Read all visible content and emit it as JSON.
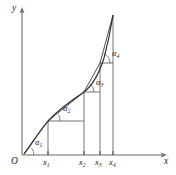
{
  "figure": {
    "background_color": "#ffffff",
    "curve_color": "#2b2b2b",
    "axis_color": "#6b6b6b"
  },
  "axes": {
    "y_label": "y",
    "x_label": "x",
    "origin_label": "O",
    "x_axis_y": 155,
    "y_axis_x": 22,
    "x_axis_end": 168,
    "y_axis_top": 8
  },
  "ticks": [
    {
      "id": "x1",
      "label": "x",
      "subscript": "1",
      "x": 48
    },
    {
      "id": "x2",
      "label": "x",
      "subscript": "2",
      "x": 84
    },
    {
      "id": "x3",
      "label": "x",
      "subscript": "3",
      "x": 100
    },
    {
      "id": "x4",
      "label": "x",
      "subscript": "4",
      "x": 113
    }
  ],
  "angles": [
    {
      "id": "alpha1",
      "label": "α",
      "subscript": "1",
      "at_x": 22,
      "at_y": 155,
      "label_x": 35,
      "label_y": 138
    },
    {
      "id": "alpha2",
      "label": "α",
      "subscript": "2",
      "at_x": 48,
      "at_y": 120,
      "label_x": 63,
      "label_y": 104
    },
    {
      "id": "alpha3",
      "label": "α",
      "subscript": "3",
      "at_x": 84,
      "at_y": 93,
      "label_x": 96,
      "label_y": 78
    },
    {
      "id": "alpha4",
      "label": "α",
      "subscript": "4",
      "at_x": 100,
      "at_y": 63,
      "label_x": 112,
      "label_y": 49
    }
  ],
  "curve": {
    "type": "path",
    "description": "monotone increasing convex curve rising steeply to a sharp peak",
    "d": "M 24 154 C 30 146, 38 133, 48 121 C 58 110, 72 100, 84 92 C 93 85, 99 74, 104 58 C 108 43, 111 28, 113 15"
  },
  "chords": [
    {
      "id": "chord-0-1",
      "from_x": 24,
      "from_y": 154,
      "to_x": 48,
      "to_y": 121
    },
    {
      "id": "chord-1-2",
      "from_x": 48,
      "from_y": 121,
      "to_x": 84,
      "to_y": 92
    },
    {
      "id": "chord-2-3",
      "from_x": 84,
      "from_y": 92,
      "to_x": 100,
      "to_y": 63
    },
    {
      "id": "chord-3-4",
      "from_x": 100,
      "from_y": 63,
      "to_x": 113,
      "to_y": 15
    }
  ],
  "drop_lines": [
    {
      "id": "drop-x1",
      "x": 48,
      "top_y": 121,
      "bottom_y": 155
    },
    {
      "id": "drop-x2",
      "x": 84,
      "top_y": 92,
      "bottom_y": 155
    },
    {
      "id": "drop-x3",
      "x": 100,
      "top_y": 63,
      "bottom_y": 155
    },
    {
      "id": "drop-x4",
      "x": 113,
      "top_y": 15,
      "bottom_y": 155
    }
  ],
  "step_lines": [
    {
      "id": "step-1",
      "y": 121,
      "from_x": 48,
      "to_x": 84
    },
    {
      "id": "step-2",
      "y": 92,
      "from_x": 84,
      "to_x": 100
    },
    {
      "id": "step-3",
      "y": 63,
      "from_x": 100,
      "to_x": 113
    }
  ]
}
